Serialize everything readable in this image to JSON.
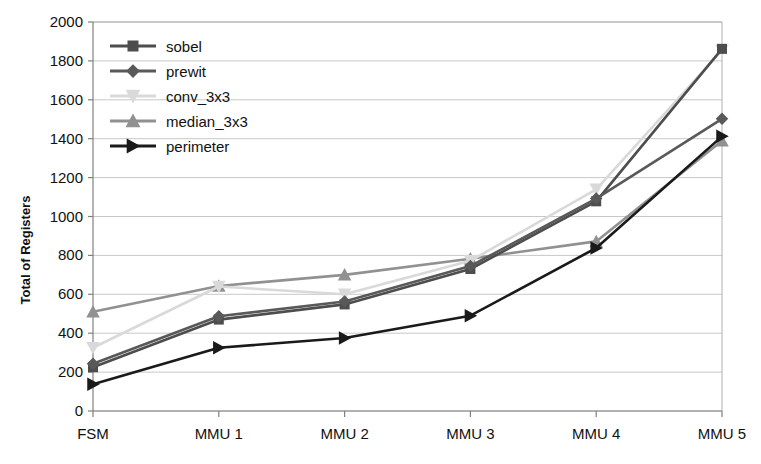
{
  "chart_data": {
    "type": "line",
    "title": "",
    "xlabel": "",
    "ylabel": "Total of Registers",
    "categories": [
      "FSM",
      "MMU 1",
      "MMU 2",
      "MMU 3",
      "MMU 4",
      "MMU 5"
    ],
    "ylim": [
      0,
      2000
    ],
    "ytick_step": 200,
    "yticks": [
      0,
      200,
      400,
      600,
      800,
      1000,
      1200,
      1400,
      1600,
      1800,
      2000
    ],
    "grid": true,
    "legend_position": "top-left-inside",
    "series": [
      {
        "name": "sobel",
        "marker": "square",
        "color": "#4d4d4d",
        "values": [
          225,
          470,
          548,
          730,
          1078,
          1862
        ]
      },
      {
        "name": "prewit",
        "marker": "diamond",
        "color": "#595959",
        "values": [
          243,
          487,
          563,
          745,
          1092,
          1502
        ]
      },
      {
        "name": "conv_3x3",
        "marker": "triangle-down",
        "color": "#d9d9d9",
        "values": [
          325,
          640,
          600,
          772,
          1140,
          1855
        ]
      },
      {
        "name": "median_3x3",
        "marker": "triangle-up",
        "color": "#919191",
        "values": [
          510,
          643,
          700,
          783,
          872,
          1390
        ]
      },
      {
        "name": "perimeter",
        "marker": "triangle-right",
        "color": "#1a1a1a",
        "values": [
          138,
          325,
          375,
          490,
          838,
          1412
        ]
      }
    ]
  }
}
